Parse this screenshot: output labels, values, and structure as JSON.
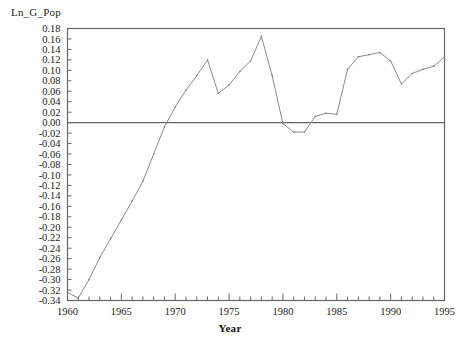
{
  "chart_data": {
    "type": "line",
    "title": "",
    "ylabel": "Ln_G_Pop",
    "xlabel": "Year",
    "xlim": [
      1960,
      1995
    ],
    "ylim": [
      -0.34,
      0.18
    ],
    "grid": false,
    "legend": null,
    "zero_reference_line": 0.0,
    "line_color": "#808080",
    "axis_color": "#555555",
    "zero_line_color": "#666666",
    "x": [
      1960,
      1961,
      1962,
      1963,
      1964,
      1965,
      1966,
      1967,
      1968,
      1969,
      1970,
      1971,
      1972,
      1973,
      1974,
      1975,
      1976,
      1977,
      1978,
      1979,
      1980,
      1981,
      1982,
      1983,
      1984,
      1985,
      1986,
      1987,
      1988,
      1989,
      1990,
      1991,
      1992,
      1993,
      1994,
      1995
    ],
    "values": [
      -0.325,
      -0.335,
      -0.3,
      -0.258,
      -0.222,
      -0.186,
      -0.15,
      -0.112,
      -0.06,
      -0.008,
      0.03,
      0.062,
      0.09,
      0.12,
      0.056,
      0.072,
      0.098,
      0.118,
      0.165,
      0.09,
      -0.002,
      -0.018,
      -0.018,
      0.012,
      0.018,
      0.016,
      0.102,
      0.126,
      0.13,
      0.134,
      0.118,
      0.074,
      0.094,
      0.102,
      0.108,
      0.126
    ],
    "xticks_major": [
      1960,
      1965,
      1970,
      1975,
      1980,
      1985,
      1990,
      1995
    ],
    "xtick_labels": [
      "1960",
      "1965",
      "1970",
      "1975",
      "1980",
      "1985",
      "1990",
      "1995"
    ],
    "xticks_minor_step": 1,
    "yticks": [
      0.18,
      0.16,
      0.14,
      0.12,
      0.1,
      0.08,
      0.06,
      0.04,
      0.02,
      0.0,
      -0.02,
      -0.04,
      -0.06,
      -0.08,
      -0.1,
      -0.12,
      -0.14,
      -0.16,
      -0.18,
      -0.2,
      -0.22,
      -0.24,
      -0.26,
      -0.28,
      -0.3,
      -0.32,
      -0.34
    ],
    "ytick_labels": [
      "0.18",
      "0.16",
      "0.14",
      "0.12",
      "0.10",
      "0.08",
      "0.06",
      "0.04",
      "0.02",
      "0.00",
      "-0.02",
      "-0.04",
      "-0.06",
      "-0.08",
      "-0.10",
      "-0.12",
      "-0.14",
      "-0.16",
      "-0.18",
      "-0.20",
      "-0.22",
      "-0.24",
      "-0.26",
      "-0.28",
      "-0.30",
      "-0.32",
      "-0.34"
    ]
  }
}
